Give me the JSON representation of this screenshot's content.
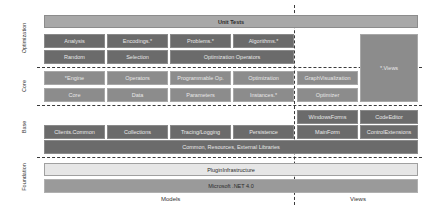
{
  "layers": {
    "optimization": "Optimization",
    "core": "Core",
    "base": "Base",
    "foundation": "Foundation"
  },
  "columns": {
    "models": "Models",
    "views": "Views"
  },
  "unit_tests": "Unit Tests",
  "optimization": {
    "row1": [
      "Analysis",
      "Encodings.*",
      "Problems.*",
      "Algorithms.*"
    ],
    "row2": [
      "Random",
      "Selection",
      "Optimization Operators"
    ]
  },
  "core": {
    "row1": [
      "*Engine",
      "Operators",
      "Programmable Op.",
      "Optimization"
    ],
    "row2": [
      "Core",
      "Data",
      "Parameters",
      "Instances.*"
    ],
    "views_row1": "GraphVisualization",
    "views_row2": "Optimizer",
    "views_all": "*.Views"
  },
  "base": {
    "views_row1": [
      "WindowsForms",
      "CodeEditor"
    ],
    "row2": [
      "Clients.Common",
      "Collections",
      "Tracing/Logging",
      "Persistence"
    ],
    "views_row2": [
      "MainForm",
      "ControlExtensions"
    ],
    "common": "Common, Resources, External Libraries"
  },
  "foundation": {
    "plugin": "PluginInfrastructure",
    "net": "Microsoft .NET 4.0"
  }
}
